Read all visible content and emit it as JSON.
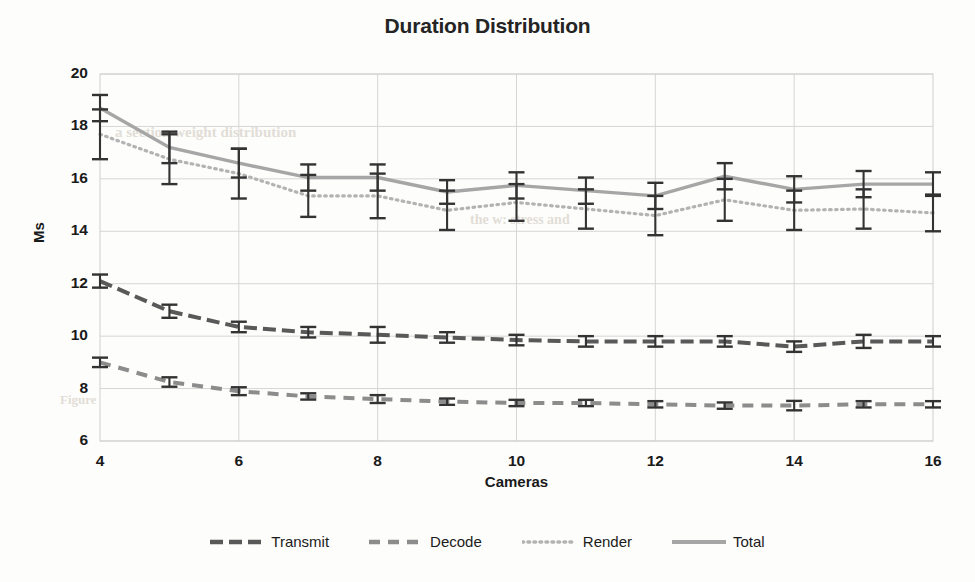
{
  "chart_data": {
    "type": "line",
    "title": "Duration Distribution",
    "xlabel": "Cameras",
    "ylabel": "Ms",
    "xlim": [
      4,
      16
    ],
    "ylim": [
      6,
      20
    ],
    "ytick_labels": [
      "20",
      "18",
      "16",
      "14",
      "12",
      "10",
      "8",
      "6"
    ],
    "yticks": [
      20,
      18,
      16,
      14,
      12,
      10,
      8,
      6
    ],
    "xtick_labels": [
      "4",
      "6",
      "8",
      "10",
      "12",
      "14",
      "16"
    ],
    "xticks": [
      4,
      6,
      8,
      10,
      12,
      14,
      16
    ],
    "x": [
      4,
      5,
      6,
      7,
      8,
      9,
      10,
      11,
      12,
      13,
      14,
      15,
      16
    ],
    "grid": true,
    "legend_position": "bottom",
    "series": [
      {
        "name": "Transmit",
        "style": "dash-dot",
        "color": "#595959",
        "values": [
          12.1,
          10.95,
          10.35,
          10.15,
          10.05,
          9.95,
          9.85,
          9.8,
          9.8,
          9.8,
          9.6,
          9.8,
          9.8
        ],
        "error": [
          0.25,
          0.25,
          0.2,
          0.2,
          0.3,
          0.2,
          0.2,
          0.2,
          0.2,
          0.2,
          0.2,
          0.25,
          0.2
        ]
      },
      {
        "name": "Decode",
        "style": "long-dash",
        "color": "#8c8c8c",
        "values": [
          9.0,
          8.25,
          7.9,
          7.7,
          7.6,
          7.5,
          7.45,
          7.45,
          7.4,
          7.35,
          7.35,
          7.4,
          7.4
        ],
        "error": [
          0.18,
          0.18,
          0.15,
          0.12,
          0.15,
          0.12,
          0.12,
          0.12,
          0.12,
          0.12,
          0.18,
          0.12,
          0.12
        ]
      },
      {
        "name": "Render",
        "style": "dotted",
        "color": "#b3b3b3",
        "values": [
          17.7,
          16.75,
          16.2,
          15.35,
          15.35,
          14.8,
          15.1,
          14.85,
          14.6,
          15.2,
          14.8,
          14.85,
          14.7
        ],
        "error": [
          0.95,
          0.95,
          0.95,
          0.8,
          0.85,
          0.75,
          0.7,
          0.75,
          0.75,
          0.8,
          0.75,
          0.75,
          0.7
        ]
      },
      {
        "name": "Total",
        "style": "solid",
        "color": "#a6a6a6",
        "values": [
          18.7,
          17.2,
          16.6,
          16.05,
          16.05,
          15.5,
          15.75,
          15.55,
          15.35,
          16.1,
          15.6,
          15.8,
          15.8
        ],
        "error": [
          0.5,
          0.6,
          0.55,
          0.5,
          0.5,
          0.45,
          0.5,
          0.5,
          0.5,
          0.5,
          0.5,
          0.5,
          0.45
        ]
      }
    ]
  },
  "bleed_text": {
    "line1": "a section weight distribution",
    "line2": "the w: stress and",
    "line3": "Figure"
  }
}
